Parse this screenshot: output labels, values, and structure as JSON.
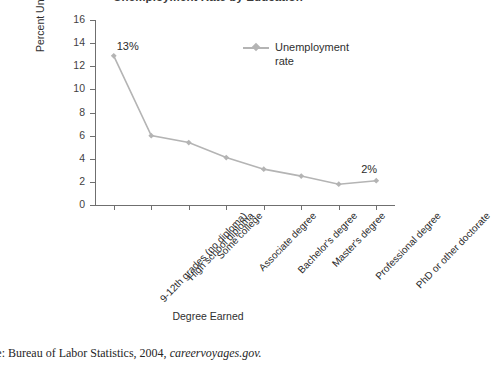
{
  "chart_data": {
    "type": "line",
    "title": "Unemployment Rate by Education",
    "xlabel": "Degree Earned",
    "ylabel": "Percent Unemployed",
    "ylim": [
      0,
      16
    ],
    "yticks": [
      0,
      2,
      4,
      6,
      8,
      10,
      12,
      14,
      16
    ],
    "grid": false,
    "legend_position": "upper-right-inside",
    "categories": [
      "9-12th grades (no diploma)",
      "High school diploma",
      "Some college",
      "Associate degree",
      "Bachelor's degree",
      "Master's degree",
      "Professional degree",
      "PhD or other doctorate"
    ],
    "series": [
      {
        "name": "Unemployment rate",
        "color": "#b4b4b4",
        "values": [
          12.9,
          6.0,
          5.4,
          4.1,
          3.1,
          2.5,
          1.8,
          2.1
        ]
      }
    ],
    "annotations": [
      {
        "text": "13%",
        "category_index": 0,
        "value": 12.9
      },
      {
        "text": "2%",
        "category_index": 7,
        "value": 2.1
      }
    ]
  },
  "legend": {
    "entries": [
      {
        "label_line1": "Unemployment",
        "label_line2": "rate"
      }
    ]
  },
  "source_note": {
    "prefix": "urce: Bureau of Labor Statistics, 2004, ",
    "italic": "careervoyages.gov."
  }
}
